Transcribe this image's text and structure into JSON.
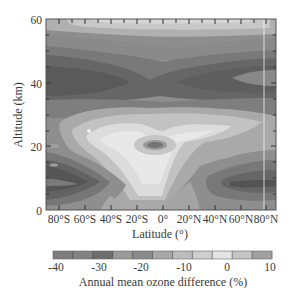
{
  "chart_data": {
    "type": "heatmap",
    "subtype": "filled-contour",
    "title": "",
    "xlabel": "Latitude (°)",
    "ylabel": "Altitude (km)",
    "x_ticks": [
      "80°S",
      "60°S",
      "40°S",
      "20°S",
      "0°",
      "20°N",
      "40°N",
      "60°N",
      "80°N"
    ],
    "x_tick_values": [
      -80,
      -60,
      -40,
      -20,
      0,
      20,
      40,
      60,
      80
    ],
    "y_ticks": [
      "0",
      "20",
      "40",
      "60"
    ],
    "y_tick_values": [
      0,
      20,
      40,
      60
    ],
    "xlim": [
      -90,
      90
    ],
    "ylim": [
      0,
      60
    ],
    "colorbar": {
      "label": "Annual mean ozone difference (%)",
      "ticks": [
        "-40",
        "-30",
        "-20",
        "-10",
        "0",
        "10"
      ],
      "tick_values": [
        -40,
        -30,
        -20,
        -10,
        0,
        10
      ],
      "range": [
        -40,
        12
      ],
      "levels": [
        -40,
        -35,
        -30,
        -25,
        -20,
        -15,
        -10,
        -5,
        0,
        5,
        10
      ],
      "colors": [
        "#7c7c7c",
        "#828282",
        "#6e6e6e",
        "#9a9a9a",
        "#8a8a8a",
        "#a8a8a8",
        "#bdbdbd",
        "#cfcfcf",
        "#e4e4e4",
        "#c4c4c4",
        "#a0a0a0"
      ]
    },
    "features": [
      {
        "region": "upper stratosphere ~55-60 km, mid-latitudes",
        "value_range": "-5 to 0",
        "shade": "light"
      },
      {
        "region": "~35-45 km band, all latitudes",
        "value_range": "-35 to -25",
        "shade": "dark",
        "note": "minimum near 60-80°S ~40 km and 40-80°N ~40 km"
      },
      {
        "region": "~45-52 km band",
        "value_range": "-20 to -10",
        "shade": "medium"
      },
      {
        "region": "tropical lower stratosphere ~15-30 km",
        "value_range": "-5 to 5",
        "shade": "lightest"
      },
      {
        "region": "equator ~21 km small pocket",
        "value_range": "-20 to -15",
        "shade": "medium-dark"
      },
      {
        "region": "southern high latitudes 5-20 km",
        "value_range": "-40 to -30",
        "shade": "darkest"
      },
      {
        "region": "northern high latitudes 5-15 km",
        "value_range": "-35 to -25",
        "shade": "dark"
      }
    ],
    "grid": false,
    "legend_position": "colorbar-bottom"
  }
}
